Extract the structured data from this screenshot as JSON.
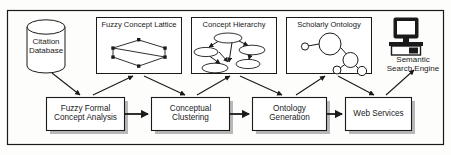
{
  "diagram": {
    "type": "flow-diagram",
    "colors": {
      "stroke": "#1a1a1a",
      "background": "#fdfdfb",
      "box_fill": "#ffffff",
      "shadow": "#b8b8b8",
      "node_fill": "#ffffff"
    },
    "datastore": {
      "label": "Citation\nDatabase",
      "shape": "cylinder"
    },
    "artifacts": [
      {
        "id": "fuzzy-concept-lattice",
        "title": "Fuzzy Concept Lattice",
        "graphic": "hexagonal-lattice"
      },
      {
        "id": "concept-hierarchy",
        "title": "Concept Hierarchy",
        "graphic": "directed-ellipse-graph"
      },
      {
        "id": "scholarly-ontology",
        "title": "Scholarly Ontology",
        "graphic": "circle-node-graph"
      }
    ],
    "endpoint": {
      "id": "semantic-search-engine",
      "label": "Semantic\nSearch Engine",
      "graphic": "desktop-computer"
    },
    "processes": [
      {
        "id": "fuzzy-formal-concept-analysis",
        "label": "Fuzzy Formal\nConcept Analysis"
      },
      {
        "id": "conceptual-clustering",
        "label": "Conceptual\nClustering"
      },
      {
        "id": "ontology-generation",
        "label": "Ontology\nGeneration"
      },
      {
        "id": "web-services",
        "label": "Web Services"
      }
    ],
    "flows": [
      {
        "from": "citation-database",
        "to": "fuzzy-formal-concept-analysis"
      },
      {
        "from": "fuzzy-formal-concept-analysis",
        "to": "fuzzy-concept-lattice"
      },
      {
        "from": "fuzzy-concept-lattice",
        "to": "conceptual-clustering"
      },
      {
        "from": "conceptual-clustering",
        "to": "concept-hierarchy"
      },
      {
        "from": "concept-hierarchy",
        "to": "ontology-generation"
      },
      {
        "from": "ontology-generation",
        "to": "scholarly-ontology"
      },
      {
        "from": "scholarly-ontology",
        "to": "web-services"
      },
      {
        "from": "web-services",
        "to": "semantic-search-engine"
      },
      {
        "from": "fuzzy-formal-concept-analysis",
        "to": "conceptual-clustering"
      },
      {
        "from": "conceptual-clustering",
        "to": "ontology-generation"
      },
      {
        "from": "ontology-generation",
        "to": "web-services"
      }
    ]
  }
}
